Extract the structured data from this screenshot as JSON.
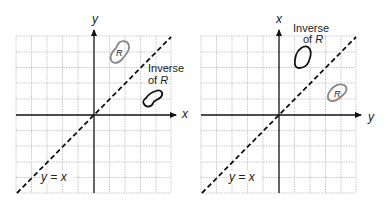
{
  "panels": [
    {
      "id": "left",
      "axis_labels": {
        "horizontal": "x",
        "vertical": "y"
      },
      "line_label": "y = x",
      "region_label": "R",
      "inverse_label_line1": "Inverse",
      "inverse_label_line2": "of",
      "inverse_label_italic": "R"
    },
    {
      "id": "right",
      "axis_labels": {
        "horizontal": "y",
        "vertical": "x"
      },
      "line_label": "y = x",
      "region_label": "R",
      "inverse_label_line1": "Inverse",
      "inverse_label_line2": "of",
      "inverse_label_italic": "R"
    }
  ],
  "colors": {
    "grid": "#bbbbbb",
    "axis": "#111111",
    "region_R": "#888888",
    "inverse_region": "#111111"
  }
}
